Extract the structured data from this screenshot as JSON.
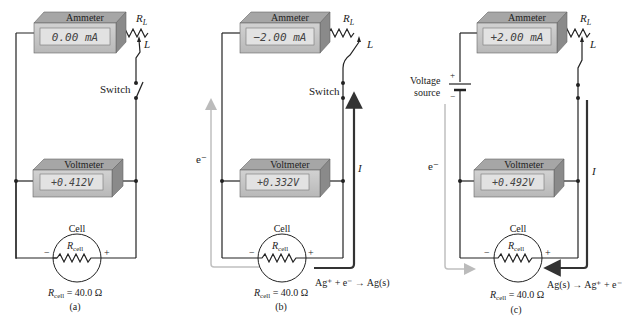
{
  "figure": {
    "panels": [
      {
        "id": "a",
        "caption": "(a)",
        "ammeter": {
          "label": "Ammeter",
          "reading": "0.00 mA"
        },
        "voltmeter": {
          "label": "Voltmeter",
          "reading": "+0.412V"
        },
        "load_resistor": {
          "label": "R_L",
          "sub": "L",
          "tap_label": "L"
        },
        "switch_label": "Switch",
        "cell": {
          "label": "Cell",
          "inner_label": "R",
          "inner_sub": "cell",
          "minus": "−",
          "plus": "+",
          "resistance": "R",
          "resistance_sub": "cell",
          "resistance_value": " = 40.0 Ω"
        }
      },
      {
        "id": "b",
        "caption": "(b)",
        "ammeter": {
          "label": "Ammeter",
          "reading": "−2.00 mA"
        },
        "voltmeter": {
          "label": "Voltmeter",
          "reading": "+0.332V"
        },
        "load_resistor": {
          "label": "R_L",
          "sub": "L",
          "tap_label": "L"
        },
        "switch_label": "Switch",
        "electron_label": "e⁻",
        "current_label": "I",
        "reaction": "Ag⁺ + e⁻ → Ag(s)",
        "cell": {
          "label": "Cell",
          "inner_label": "R",
          "inner_sub": "cell",
          "minus": "−",
          "plus": "+",
          "resistance": "R",
          "resistance_sub": "cell",
          "resistance_value": " = 40.0 Ω"
        }
      },
      {
        "id": "c",
        "caption": "(c)",
        "ammeter": {
          "label": "Ammeter",
          "reading": "+2.00 mA"
        },
        "voltmeter": {
          "label": "Voltmeter",
          "reading": "+0.492V"
        },
        "load_resistor": {
          "label": "R_L",
          "sub": "L",
          "tap_label": "L"
        },
        "voltage_source": {
          "line1": "Voltage",
          "line2": "source",
          "plus": "+",
          "minus": "−"
        },
        "electron_label": "e⁻",
        "current_label": "I",
        "reaction": "Ag(s) → Ag⁺ + e⁻",
        "cell": {
          "label": "Cell",
          "inner_label": "R",
          "inner_sub": "cell",
          "minus": "−",
          "plus": "+",
          "resistance": "R",
          "resistance_sub": "cell",
          "resistance_value": " = 40.0 Ω"
        }
      }
    ],
    "colors": {
      "wire": "#222222",
      "meter_face": "#c8c8c8",
      "meter_top": "#a9a9a9",
      "meter_side": "#8e8e8e",
      "lcd": "#e0e0e0",
      "electron_arrow": "#c0c0c0",
      "current_arrow": "#333333"
    }
  }
}
